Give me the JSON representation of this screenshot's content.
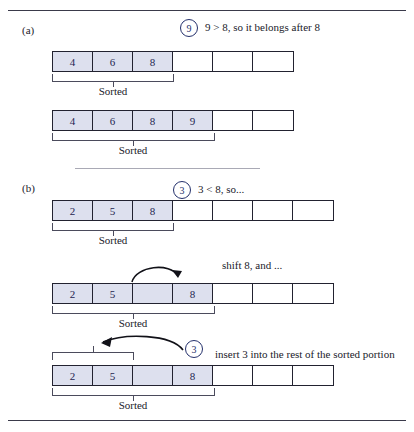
{
  "figure": {
    "parts": [
      {
        "id": "a",
        "label": "(a)",
        "badge": "9",
        "note": "9 > 8, so it belongs after 8",
        "rows": [
          {
            "name": "array-a-1",
            "cells": [
              "4",
              "6",
              "8",
              "",
              "",
              ""
            ],
            "shaded": [
              true,
              true,
              true,
              false,
              false,
              false
            ],
            "sorted_label": "Sorted",
            "sorted_span": 3
          },
          {
            "name": "array-a-2",
            "cells": [
              "4",
              "6",
              "8",
              "9",
              "",
              ""
            ],
            "shaded": [
              true,
              true,
              true,
              true,
              false,
              false
            ],
            "sorted_label": "Sorted",
            "sorted_span": 4
          }
        ]
      },
      {
        "id": "b",
        "label": "(b)",
        "badge": "3",
        "note": "3 < 8, so...",
        "note_shift": "shift 8, and ...",
        "badge_insert": "3",
        "note_insert": "insert 3 into the rest of the sorted portion",
        "rows": [
          {
            "name": "array-b-1",
            "cells": [
              "2",
              "5",
              "8",
              "",
              "",
              "",
              ""
            ],
            "shaded": [
              true,
              true,
              true,
              false,
              false,
              false,
              false
            ],
            "sorted_label": "Sorted",
            "sorted_span": 3
          },
          {
            "name": "array-b-2",
            "cells": [
              "2",
              "5",
              "",
              "8",
              "",
              "",
              ""
            ],
            "shaded": [
              true,
              true,
              true,
              true,
              false,
              false,
              false
            ],
            "sorted_label": "Sorted",
            "sorted_span": 4
          },
          {
            "name": "array-b-3",
            "cells": [
              "2",
              "5",
              "",
              "8",
              "",
              "",
              ""
            ],
            "shaded": [
              true,
              true,
              true,
              true,
              false,
              false,
              false
            ],
            "sorted_label": "Sorted",
            "sorted_span": 4,
            "upper_bracket_span": 2
          }
        ]
      }
    ],
    "colors": {
      "shaded_cell": "#dde0ee",
      "border": "#222230",
      "badge": "#24306b",
      "text": "#1a1a2a"
    }
  }
}
